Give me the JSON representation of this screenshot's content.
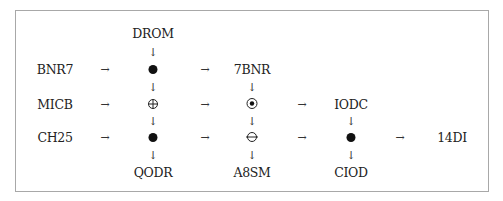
{
  "diagram": {
    "inputs_left": [
      "BNR7",
      "MICB",
      "CH25"
    ],
    "inputs_top": [
      "DROM"
    ],
    "middle_labels": {
      "col2_top": "7BNR",
      "col3_top": "IODC"
    },
    "outputs_bottom": [
      "QODR",
      "A8SM",
      "CIOD"
    ],
    "output_right": "14DI",
    "nodes": [
      {
        "id": "c1r1",
        "symbol": "filled-dot",
        "row": 1,
        "col": 1
      },
      {
        "id": "c1r2",
        "symbol": "circled-plus",
        "row": 2,
        "col": 1
      },
      {
        "id": "c1r3",
        "symbol": "filled-dot",
        "row": 3,
        "col": 1
      },
      {
        "id": "c2r2",
        "symbol": "circled-dot",
        "row": 2,
        "col": 2
      },
      {
        "id": "c2r3",
        "symbol": "circled-minus",
        "row": 3,
        "col": 2
      },
      {
        "id": "c3r3",
        "symbol": "filled-dot",
        "row": 3,
        "col": 3
      }
    ],
    "arrow_glyph_right": "→",
    "arrow_glyph_down": "↓"
  }
}
